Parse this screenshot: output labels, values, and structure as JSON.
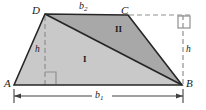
{
  "figure": {
    "canvas": {
      "width": 206,
      "height": 110,
      "background": "#ffffff"
    },
    "colors": {
      "region_one_fill": "#c9c9c9",
      "region_two_fill": "#a8a8a8",
      "outline": "#262626",
      "dashed": "#8a8a8a",
      "label": "#1a1a1a"
    },
    "vertices": [
      {
        "name": "A",
        "label": "A",
        "x": 14,
        "y": 85
      },
      {
        "name": "B",
        "label": "B",
        "x": 182,
        "y": 85
      },
      {
        "name": "C",
        "label": "C",
        "x": 128,
        "y": 15
      },
      {
        "name": "D",
        "label": "D",
        "x": 45,
        "y": 14
      }
    ],
    "regions": [
      {
        "name": "region-one",
        "label": "I",
        "fill": "#c9c9c9"
      },
      {
        "name": "region-two",
        "label": "II",
        "fill": "#a8a8a8"
      }
    ],
    "dimensions": [
      {
        "name": "top-base",
        "label": "b",
        "subscript": "2"
      },
      {
        "name": "bottom-base",
        "label": "b",
        "subscript": "1"
      },
      {
        "name": "height-left",
        "label": "h"
      },
      {
        "name": "height-right",
        "label": "h"
      }
    ],
    "right_angle_marks": [
      {
        "name": "right-angle-base",
        "x": 45,
        "y": 72
      },
      {
        "name": "right-angle-top-right",
        "x": 178,
        "y": 16
      }
    ]
  }
}
